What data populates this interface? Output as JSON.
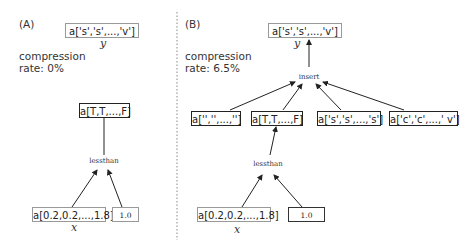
{
  "panels": [
    {
      "label": "(A)",
      "compression_label": "compression",
      "rate_label": "rate: 0%",
      "output_node": "a['s','s',...,'v']",
      "output_var": "y",
      "result_node": "a[T,T,...,F]",
      "op_node": "lessthan",
      "input_node": "a[0.2,0.2,...,1.8]",
      "input_var": "x",
      "const_node": "1.0"
    },
    {
      "label": "(B)",
      "compression_label": "compression",
      "rate_label": "rate: 6.5%",
      "output_node": "a['s','s',...,'v']",
      "output_var": "y",
      "insert_op": "insert",
      "insert_inputs": [
        "a['','',...,'']",
        "a[T,T,...,F]",
        "a['s','s',...,'s']",
        "a['c','c',...,' v']"
      ],
      "op_node": "lessthan",
      "input_node": "a[0.2,0.2,...,1.8]",
      "input_var": "x",
      "const_node": "1.0"
    }
  ]
}
